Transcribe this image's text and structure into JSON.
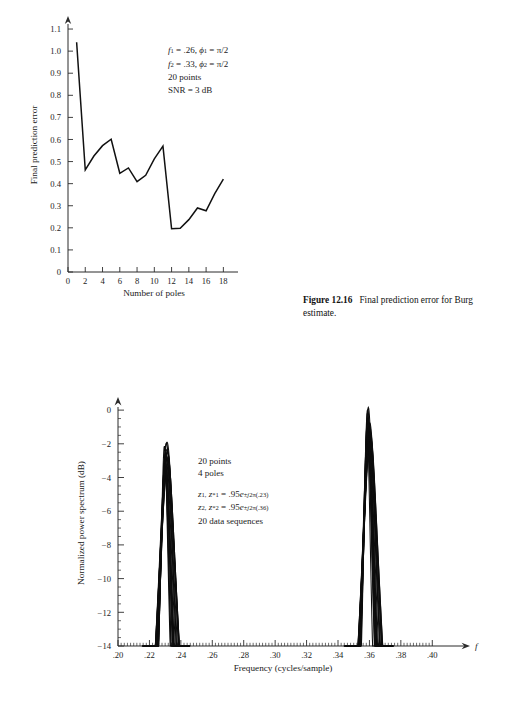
{
  "page": {
    "background": "#ffffff",
    "ink": "#111111"
  },
  "figure1": {
    "name": "final-prediction-error-plot",
    "annotation": {
      "line1": {
        "f_sym": "f",
        "f_sub": "1",
        "f_val": " = .26,",
        "phi_sym": "ϕ",
        "phi_sub": "1",
        "phi_val": " = π/2"
      },
      "line2": {
        "f_sym": "f",
        "f_sub": "2",
        "f_val": " = .33,",
        "phi_sym": "ϕ",
        "phi_sub": "2",
        "phi_val": " = π/2"
      },
      "line3": "20 points",
      "line4": "SNR = 3 dB"
    },
    "caption": {
      "label": "Figure 12.16",
      "text": "Final prediction error for Burg estimate."
    }
  },
  "figure2": {
    "name": "normalized-power-spectrum-plot",
    "annotation": {
      "line1": "20 points",
      "line2": "4 poles",
      "line3": {
        "z": "z",
        "z_sub": "1,",
        "zc": "z",
        "zc_sub": "1",
        "zc_sup": "*",
        "eq": " = .95",
        "e": "e",
        "exp_pm": "±",
        "exp_j": "j",
        "exp_rest": "2π(.23)"
      },
      "line4": {
        "z": "z",
        "z_sub": "2,",
        "zc": "z",
        "zc_sub": "2",
        "zc_sup": "*",
        "eq": " = .95",
        "e": "e",
        "exp_pm": "±",
        "exp_j": "j",
        "exp_rest": "2π(.36)"
      },
      "line5": "20 data sequences"
    }
  },
  "chart_data": [
    {
      "type": "line",
      "name": "final-prediction-error",
      "title": "",
      "xlabel": "Number of poles",
      "ylabel": "Final prediction error",
      "xlim": [
        0,
        19
      ],
      "ylim": [
        0,
        1.15
      ],
      "xticks": [
        0,
        2,
        4,
        6,
        8,
        10,
        12,
        14,
        16,
        18
      ],
      "xticklabels": [
        "0",
        "2",
        "4",
        "6",
        "8",
        "10",
        "12",
        "14",
        "16",
        "18"
      ],
      "yticks": [
        0,
        0.1,
        0.2,
        0.3,
        0.4,
        0.5,
        0.6,
        0.7,
        0.8,
        0.9,
        1.0,
        1.1
      ],
      "yticklabels": [
        "0",
        "0.1",
        "0.2",
        "0.3",
        "0.4",
        "0.5",
        "0.6",
        "0.7",
        "0.8",
        "0.9",
        "1.0",
        "1.1"
      ],
      "grid": false,
      "legend": false,
      "x": [
        1,
        2,
        3,
        4,
        5,
        6,
        7,
        8,
        9,
        10,
        11,
        12,
        13,
        14,
        15,
        16,
        17,
        18
      ],
      "values": [
        1.04,
        0.462,
        0.525,
        0.572,
        0.601,
        0.447,
        0.471,
        0.409,
        0.438,
        0.512,
        0.57,
        0.196,
        0.198,
        0.237,
        0.29,
        0.277,
        0.355,
        0.42
      ]
    },
    {
      "type": "line",
      "name": "normalized-power-spectrum",
      "title": "",
      "xlabel": "Frequency (cycles/sample)",
      "ylabel": "Normalized power spectrum (dB)",
      "axis_var": "f",
      "xlim": [
        0.2,
        0.41
      ],
      "ylim": [
        -14,
        0.6
      ],
      "xticks": [
        0.2,
        0.22,
        0.24,
        0.26,
        0.28,
        0.3,
        0.32,
        0.34,
        0.36,
        0.38,
        0.4
      ],
      "xticklabels": [
        ".20",
        ".22",
        ".24",
        ".26",
        ".28",
        ".30",
        ".32",
        ".34",
        ".36",
        ".38",
        ".40"
      ],
      "yticks": [
        0,
        -2,
        -4,
        -6,
        -8,
        -10,
        -12,
        -14
      ],
      "yticklabels": [
        "0",
        "−2",
        "−4",
        "−6",
        "−8",
        "−10",
        "−12",
        "−14"
      ],
      "grid": false,
      "legend": false,
      "peaks": [
        {
          "center": 0.2305,
          "peak_db": -2.9,
          "half_width": 0.0035,
          "base_width": 0.006,
          "count": 20
        },
        {
          "center": 0.3595,
          "peak_db": -0.9,
          "half_width": 0.0032,
          "base_width": 0.0062,
          "count": 20
        }
      ]
    }
  ]
}
